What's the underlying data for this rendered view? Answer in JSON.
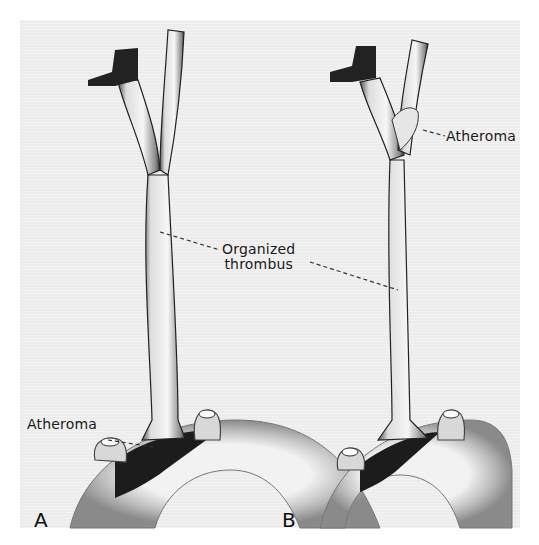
{
  "figure": {
    "panels": [
      {
        "letter": "A",
        "labels": {
          "atheroma": "Atheroma"
        }
      },
      {
        "letter": "B",
        "labels": {
          "atheroma": "Atheroma"
        }
      }
    ],
    "shared_label": {
      "line1": "Organized",
      "line2": "thrombus"
    },
    "colors": {
      "background": "#ffffff",
      "panel": "#ececec",
      "ink": "#1a1a1a",
      "shadow": "#222222"
    }
  }
}
